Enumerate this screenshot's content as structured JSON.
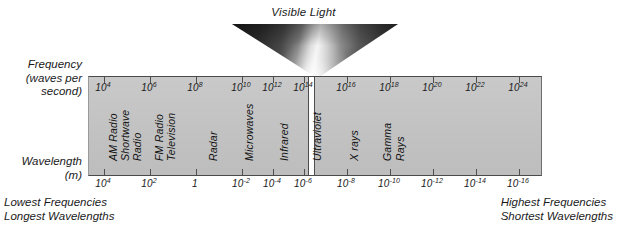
{
  "diagram": {
    "title": "Visible Light",
    "frequency_axis": {
      "caption_line1": "Frequency",
      "caption_line2": "(waves per",
      "caption_line3": "second)",
      "unit": "waves per second",
      "ticks": [
        {
          "mantissa": "10",
          "exponent": "4",
          "x": 103
        },
        {
          "mantissa": "10",
          "exponent": "6",
          "x": 149
        },
        {
          "mantissa": "10",
          "exponent": "8",
          "x": 195
        },
        {
          "mantissa": "10",
          "exponent": "10",
          "x": 241
        },
        {
          "mantissa": "10",
          "exponent": "12",
          "x": 272
        },
        {
          "mantissa": "10",
          "exponent": "14",
          "x": 303
        },
        {
          "mantissa": "10",
          "exponent": "16",
          "x": 346
        },
        {
          "mantissa": "10",
          "exponent": "18",
          "x": 389
        },
        {
          "mantissa": "10",
          "exponent": "20",
          "x": 432
        },
        {
          "mantissa": "10",
          "exponent": "22",
          "x": 475
        },
        {
          "mantissa": "10",
          "exponent": "24",
          "x": 518
        }
      ]
    },
    "wavelength_axis": {
      "caption_line1": "Wavelength",
      "caption_line2": "(m)",
      "unit": "m",
      "ticks": [
        {
          "mantissa": "10",
          "exponent": "4",
          "x": 103
        },
        {
          "mantissa": "10",
          "exponent": "2",
          "x": 149
        },
        {
          "mantissa": "1",
          "exponent": "",
          "x": 195
        },
        {
          "mantissa": "10",
          "exponent": "-2",
          "x": 241
        },
        {
          "mantissa": "10",
          "exponent": "-4",
          "x": 272
        },
        {
          "mantissa": "10",
          "exponent": "-6",
          "x": 303
        },
        {
          "mantissa": "10",
          "exponent": "-8",
          "x": 346
        },
        {
          "mantissa": "10",
          "exponent": "-10",
          "x": 389
        },
        {
          "mantissa": "10",
          "exponent": "-12",
          "x": 432
        },
        {
          "mantissa": "10",
          "exponent": "-14",
          "x": 475
        },
        {
          "mantissa": "10",
          "exponent": "-16",
          "x": 518
        }
      ]
    },
    "bands": [
      {
        "name": "AM Radio",
        "x": 118
      },
      {
        "name": "Shortwave",
        "x": 130
      },
      {
        "name": "Radio",
        "x": 142
      },
      {
        "name": "FM Radio",
        "x": 164
      },
      {
        "name": "Television",
        "x": 176
      },
      {
        "name": "Radar",
        "x": 218
      },
      {
        "name": "Microwaves",
        "x": 254
      },
      {
        "name": "Infrared",
        "x": 289
      },
      {
        "name": "Ultraviolet",
        "x": 322
      },
      {
        "name": "X rays",
        "x": 359
      },
      {
        "name": "Gamma",
        "x": 392
      },
      {
        "name": "Rays",
        "x": 405
      }
    ],
    "visible_slot_x": 307,
    "captions": {
      "left_line1": "Lowest Frequencies",
      "left_line2": "Longest Wavelengths",
      "right_line1": "Highest Frequencies",
      "right_line2": "Shortest Wavelengths"
    },
    "colors": {
      "panel_fill": "#c4c4c4",
      "panel_border": "#4a4a4a",
      "visible_slot": "#fdfdfd",
      "text": "#1a1a1a"
    }
  }
}
